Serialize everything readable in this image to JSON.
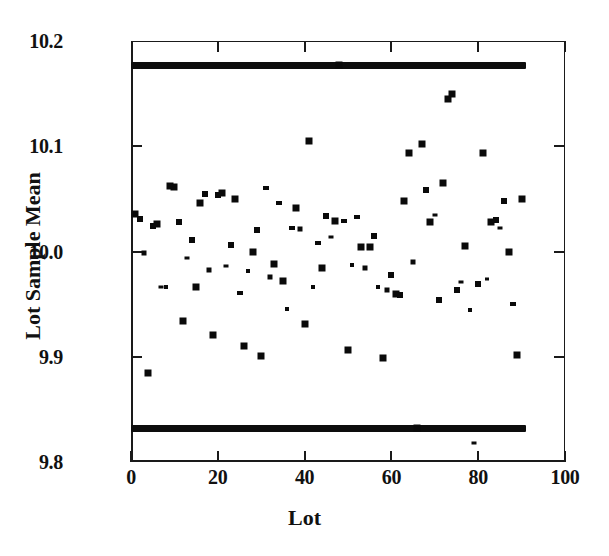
{
  "chart_data": {
    "type": "scatter",
    "title": "",
    "xlabel": "Lot",
    "ylabel": "Lot Sample Mean",
    "xlim": [
      0,
      100
    ],
    "ylim": [
      9.8,
      10.2
    ],
    "xticks": [
      0,
      20,
      40,
      60,
      80,
      100
    ],
    "xtick_labels": [
      "0",
      "20",
      "40",
      "60",
      "80",
      "100"
    ],
    "yticks": [
      9.8,
      9.9,
      10.0,
      10.1,
      10.2
    ],
    "ytick_labels": [
      "9.8",
      "9.9",
      "10.0",
      "10.1",
      "10.2"
    ],
    "grid": false,
    "legend": null,
    "marker": "square",
    "marker_color": "#0a0a0a",
    "control_limits": {
      "upper_label": "UCL",
      "upper_value": 10.177,
      "lower_label": "LCL",
      "lower_value": 9.832,
      "x_start": 0,
      "x_end": 91,
      "color": "#0d0d0d"
    },
    "x": [
      1,
      2,
      3,
      4,
      5,
      6,
      7,
      8,
      9,
      10,
      11,
      12,
      13,
      14,
      15,
      16,
      17,
      18,
      19,
      20,
      21,
      22,
      23,
      24,
      25,
      26,
      27,
      28,
      29,
      30,
      31,
      32,
      33,
      34,
      35,
      36,
      37,
      38,
      39,
      40,
      41,
      42,
      43,
      44,
      45,
      46,
      47,
      48,
      49,
      50,
      51,
      52,
      53,
      54,
      55,
      56,
      57,
      58,
      59,
      60,
      61,
      62,
      63,
      64,
      65,
      66,
      67,
      68,
      69,
      70,
      71,
      72,
      73,
      74,
      75,
      76,
      77,
      78,
      79,
      80,
      81,
      82,
      83,
      84,
      85,
      86,
      87,
      88,
      89,
      90
    ],
    "y": [
      10.036,
      10.031,
      9.999,
      9.885,
      10.024,
      10.026,
      9.966,
      9.966,
      10.062,
      10.061,
      10.028,
      9.934,
      9.994,
      10.011,
      9.966,
      10.046,
      10.055,
      9.982,
      9.921,
      10.054,
      10.056,
      9.986,
      10.006,
      10.05,
      9.961,
      9.91,
      9.981,
      10.0,
      10.02,
      9.901,
      10.06,
      9.976,
      9.988,
      10.046,
      9.972,
      9.945,
      10.022,
      10.041,
      10.021,
      9.931,
      10.105,
      9.966,
      10.008,
      9.984,
      10.034,
      10.014,
      10.029,
      10.177,
      10.029,
      9.906,
      9.987,
      10.033,
      10.004,
      9.984,
      10.004,
      10.015,
      9.966,
      9.899,
      9.963,
      9.978,
      9.96,
      9.959,
      10.048,
      10.094,
      9.99,
      9.832,
      10.102,
      10.058,
      10.028,
      10.035,
      9.954,
      10.065,
      10.145,
      10.15,
      9.963,
      9.971,
      10.005,
      9.944,
      9.818,
      9.969,
      10.094,
      9.974,
      10.028,
      10.03,
      10.022,
      10.048,
      10.0,
      9.95,
      9.902,
      10.05
    ]
  }
}
